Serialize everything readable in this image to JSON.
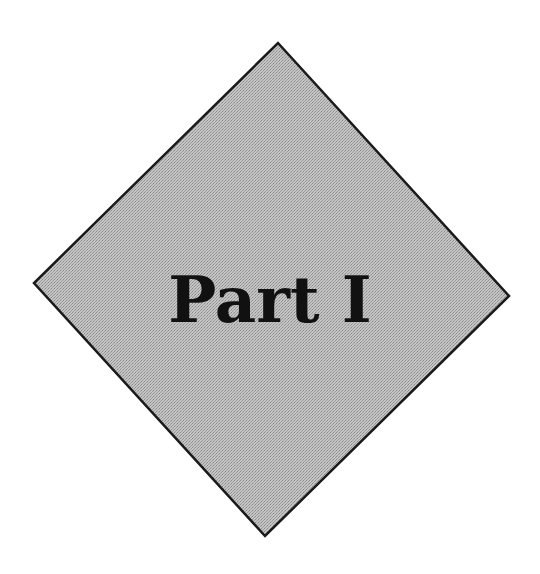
{
  "page": {
    "title": "Part I"
  },
  "diamond": {
    "fill": "#b8b8b8",
    "stroke": "#1a1a1a",
    "points": {
      "top": [
        278,
        43
      ],
      "right": [
        509,
        296
      ],
      "bottom": [
        265,
        536
      ],
      "left": [
        34,
        283
      ]
    }
  }
}
